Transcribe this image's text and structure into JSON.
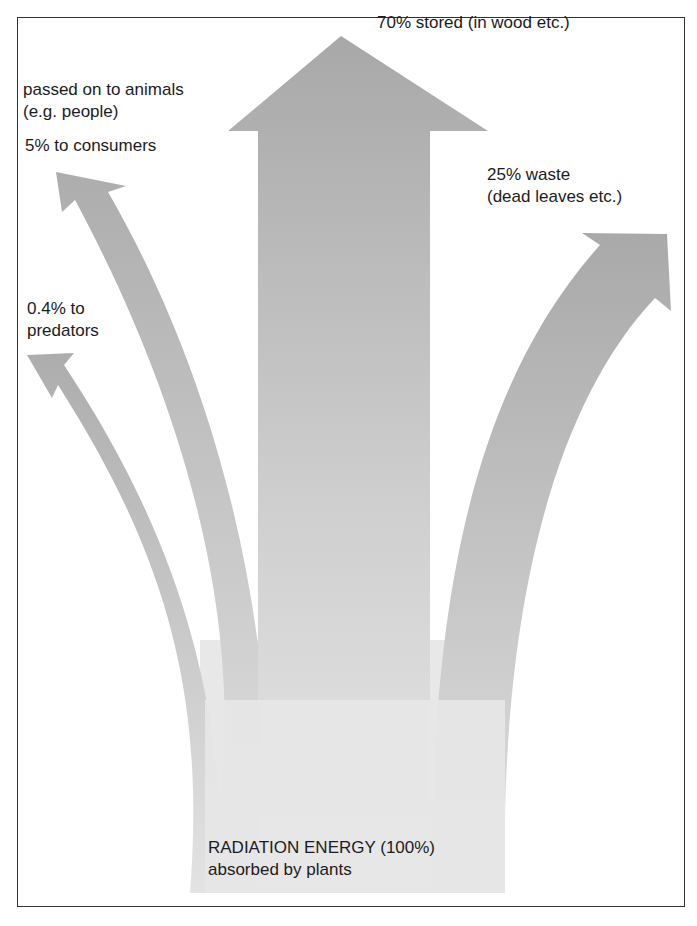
{
  "diagram": {
    "source": {
      "line1": "RADIATION ENERGY (100%)",
      "line2": "absorbed by plants"
    },
    "flows": [
      {
        "id": "stored",
        "line1": "70% stored (in wood etc.)",
        "percent": 70
      },
      {
        "id": "waste",
        "line1": "25% waste",
        "line2": "(dead leaves etc.)",
        "percent": 25
      },
      {
        "id": "animals",
        "line1": "passed on to animals",
        "line2": "(e.g. people)"
      },
      {
        "id": "consumers",
        "line1": "5% to consumers",
        "percent": 5
      },
      {
        "id": "predators",
        "line1": "0.4% to",
        "line2": "predators",
        "percent": 0.4
      }
    ],
    "colors": {
      "arrow_dark": "#a9a9a9",
      "arrow_light": "#e6e6e6",
      "border": "#333333",
      "text": "#1c1c1c"
    }
  }
}
